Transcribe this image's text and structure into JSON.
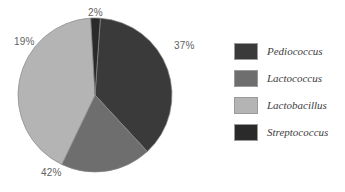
{
  "chart_data": {
    "type": "pie",
    "title": "",
    "subtitle": "",
    "xlabel": "",
    "ylabel": "",
    "grid": false,
    "legend_position": "right",
    "start_angle_deg": 4,
    "direction": "clockwise",
    "center": {
      "cx": 95,
      "cy": 95,
      "r": 77
    },
    "categories": [
      "Pediococcus",
      "Lactococcus",
      "Lactobacillus",
      "Streptococcus"
    ],
    "values": [
      37,
      19,
      42,
      2
    ],
    "unit": "%",
    "data_labels": [
      "37%",
      "19%",
      "42%",
      "2%"
    ],
    "colors": [
      "#3a3a3a",
      "#6e6e6e",
      "#b4b4b4",
      "#2a2a2a"
    ],
    "slices": [
      {
        "label": "Pediococcus",
        "value": 37,
        "data_label": "37%",
        "color": "#3a3a3a"
      },
      {
        "label": "Lactococcus",
        "value": 19,
        "data_label": "19%",
        "color": "#6e6e6e"
      },
      {
        "label": "Lactobacillus",
        "value": 42,
        "data_label": "42%",
        "color": "#b4b4b4"
      },
      {
        "label": "Streptococcus",
        "value": 2,
        "data_label": "2%",
        "color": "#2a2a2a"
      }
    ]
  },
  "labels": {
    "pediococcus_pct": "37%",
    "lactococcus_pct": "19%",
    "lactobacillus_pct": "42%",
    "streptococcus_pct": "2%"
  },
  "legend": {
    "items": [
      {
        "label": "Pediococcus",
        "color": "#3a3a3a"
      },
      {
        "label": "Lactococcus",
        "color": "#6e6e6e"
      },
      {
        "label": "Lactobacillus",
        "color": "#b4b4b4"
      },
      {
        "label": "Streptococcus",
        "color": "#2a2a2a"
      }
    ]
  },
  "style": {
    "background": "#ffffff",
    "label_color": "#5f5f5f",
    "legend_text_color": "#3d3d3d",
    "swatch_border": "#9a9a9a",
    "slice_border": "#8a8a8a"
  }
}
